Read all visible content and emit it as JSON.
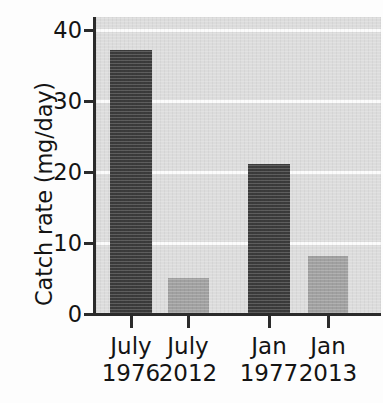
{
  "chart_data": {
    "type": "bar",
    "title": "",
    "xlabel": "",
    "ylabel": "Catch rate (mg/day)",
    "categories": [
      "July 1976",
      "July 2012",
      "Jan 1977",
      "Jan 2013"
    ],
    "category_lines": [
      {
        "line1": "July",
        "line2": "1976"
      },
      {
        "line1": "July",
        "line2": "2012"
      },
      {
        "line1": "Jan",
        "line2": "1977"
      },
      {
        "line1": "Jan",
        "line2": "2013"
      }
    ],
    "values": [
      37,
      5,
      21,
      8
    ],
    "bar_colors": [
      "#3b3b3b",
      "#a0a0a0",
      "#3b3b3b",
      "#a0a0a0"
    ],
    "ylim": [
      0,
      40
    ],
    "yticks": [
      0,
      10,
      20,
      30,
      40
    ],
    "ytick_labels": [
      "0",
      "10",
      "20",
      "30",
      "40"
    ],
    "grid": true,
    "gridline_color": "#fbfbfb",
    "plot_background": "#dcdcdc",
    "axis_color": "#2b2b2b",
    "legend": null,
    "legend_position": "none"
  },
  "axis": {
    "y_title": "Catch rate (mg/day)"
  }
}
